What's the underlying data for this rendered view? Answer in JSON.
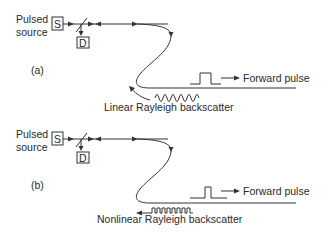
{
  "figure": {
    "panels": [
      {
        "id": "a",
        "panel_label": "(a)",
        "source_label_line1": "Pulsed",
        "source_label_line2": "source",
        "source_box": "S",
        "detector_box": "D",
        "forward_label": "Forward pulse",
        "backscatter_label": "Linear Rayleigh backscatter",
        "backscatter_waveform": "sinusoidal"
      },
      {
        "id": "b",
        "panel_label": "(b)",
        "source_label_line1": "Pulsed",
        "source_label_line2": "source",
        "source_box": "S",
        "detector_box": "D",
        "forward_label": "Forward pulse",
        "backscatter_label": "Nonlinear Rayleigh backscatter",
        "backscatter_waveform": "square-pulse train"
      }
    ],
    "colors": {
      "line": "#333333",
      "text": "#2a2a2a",
      "background": "#ffffff"
    }
  }
}
